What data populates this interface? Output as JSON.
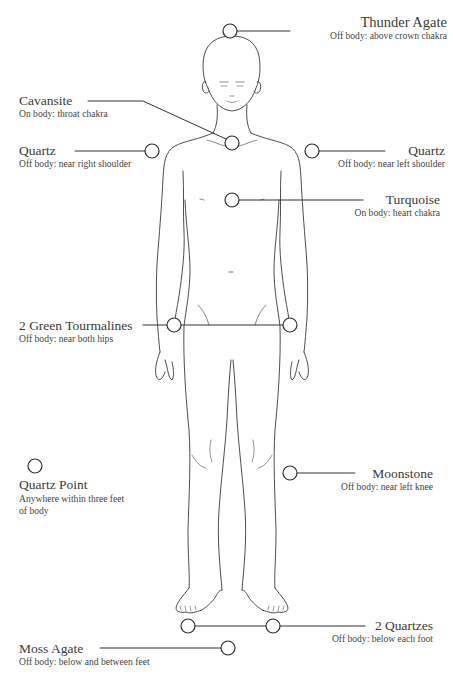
{
  "diagram": {
    "type": "crystal-layout-body-map",
    "line_color": "#333333",
    "text_color": "#3b3b3b"
  },
  "placements": [
    {
      "name": "Thunder Agate",
      "position": "Off body: above crown chakra"
    },
    {
      "name": "Cavansite",
      "position": "On body: throat chakra"
    },
    {
      "name": "Quartz",
      "position": "Off body: near right shoulder"
    },
    {
      "name": "Quartz",
      "position": "Off body: near left shoulder"
    },
    {
      "name": "Turquoise",
      "position": "On body: heart chakra"
    },
    {
      "name": "2 Green Tourmalines",
      "position": "Off body: near both hips"
    },
    {
      "name": "Moonstone",
      "position": "Off body: near left knee"
    },
    {
      "name": "Quartz Point",
      "position": "Anywhere within three feet",
      "position_line2": "of body"
    },
    {
      "name": "2 Quartzes",
      "position": "Off body: below each foot"
    },
    {
      "name": "Moss Agate",
      "position": "Off body: below and between feet"
    }
  ]
}
